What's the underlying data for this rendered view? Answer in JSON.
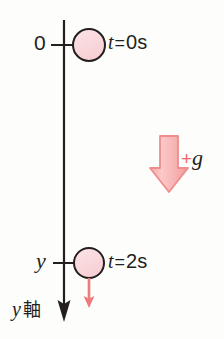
{
  "figure": {
    "background_color": "#fdfdfb",
    "axis": {
      "label": "y",
      "label_suffix": "軸",
      "direction": "down",
      "color": "#231f20",
      "line_x": 64,
      "line_top": 20,
      "line_bottom": 322
    },
    "origin_label": "0",
    "position_label": "y",
    "markers": [
      {
        "name": "ball-t0",
        "time_label": "t",
        "equals": "=",
        "value": "0s",
        "cx": 89,
        "cy": 45,
        "r": 16,
        "fill": "#f9d4d8",
        "stroke": "#231f20"
      },
      {
        "name": "ball-t2",
        "time_label": "t",
        "equals": "=",
        "value": "2s",
        "cx": 89,
        "cy": 263,
        "r": 15,
        "fill": "#f9d4d8",
        "stroke": "#231f20"
      }
    ],
    "gravity_arrow": {
      "label_plus": "+",
      "label_symbol": "g",
      "fill": "#f7b9b9",
      "stroke": "#ef8d8d",
      "plus_color": "#e8696b"
    },
    "velocity_arrow": {
      "color": "#ef7b7b",
      "x": 89,
      "y_start": 278,
      "y_end": 307
    },
    "colors": {
      "ink": "#231f20",
      "ball_fill": "#f9d4d8",
      "pink_arrow": "#f7b9b9",
      "pink_arrow_stroke": "#ef8d8d",
      "red_accent": "#ef7b7b"
    }
  }
}
